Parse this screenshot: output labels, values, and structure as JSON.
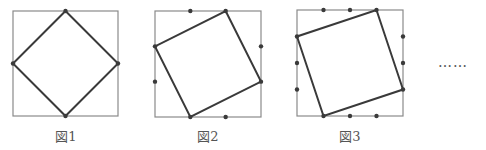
{
  "figures": [
    {
      "caption": "図1",
      "outer": {
        "x": 13,
        "y": 11,
        "size": 105
      },
      "divisions": 2,
      "inner_offset_fraction": 0.5
    },
    {
      "caption": "図2",
      "outer": {
        "x": 155,
        "y": 11,
        "size": 106
      },
      "divisions": 3,
      "inner_offset_fraction": 0.6667
    },
    {
      "caption": "図3",
      "outer": {
        "x": 297,
        "y": 10,
        "size": 106
      },
      "divisions": 4,
      "inner_offset_fraction": 0.75
    }
  ],
  "continuation": "……",
  "colors": {
    "outer_stroke": "#8a8a8a",
    "inner_stroke": "#3a3a3a",
    "points": "#3a3a3a"
  }
}
